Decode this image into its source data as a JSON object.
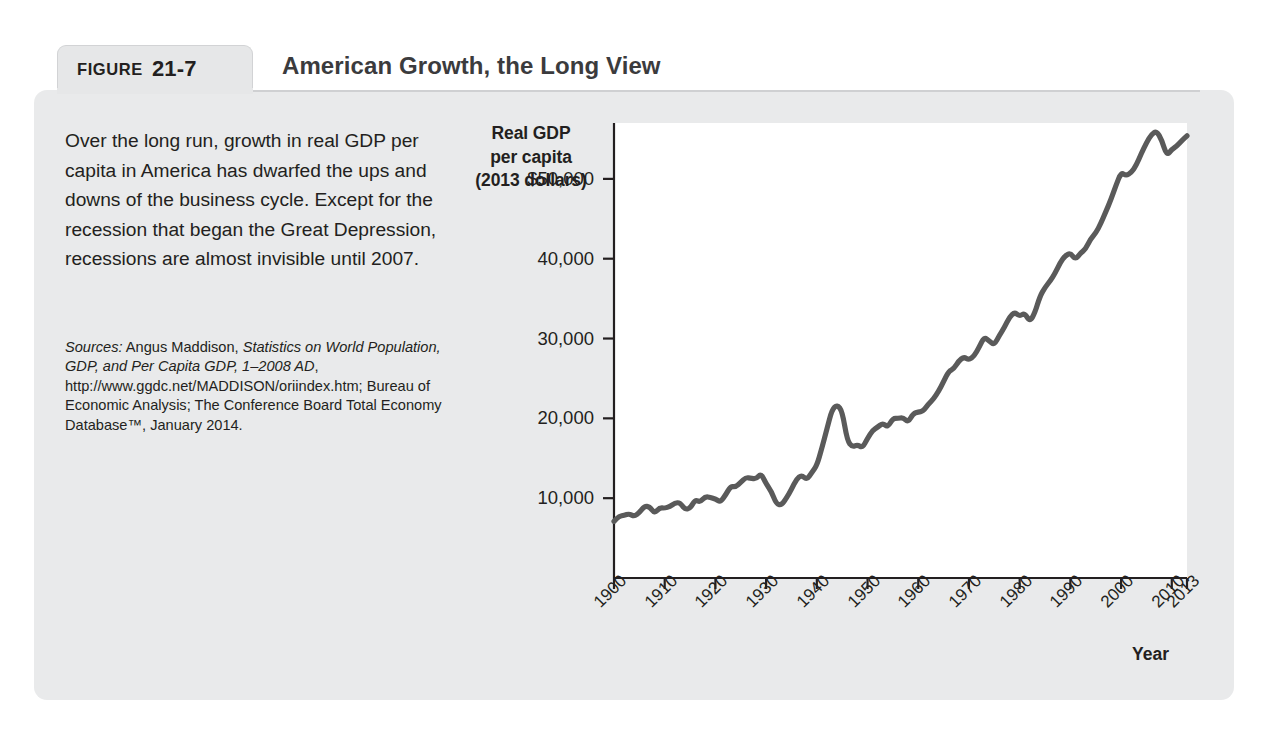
{
  "figure": {
    "tab_word": "FIGURE",
    "number": "21-7",
    "title": "American Growth, the Long View"
  },
  "caption": {
    "text": "Over the long run, growth in real GDP per capita in America has dwarfed the ups and downs of the business cycle. Except for the recession that began the Great Depression, recessions are almost invisible until 2007."
  },
  "sources": {
    "label": "Sources:",
    "part1": " Angus Maddison, ",
    "work": "Statistics on World Population, GDP, and Per Capita GDP, 1–2008 AD",
    "part2": ", http://www.ggdc.net/MADDISON/oriindex.htm; Bureau of Economic Analysis; The Conference Board Total Economy Database™, January 2014."
  },
  "colors": {
    "card_background": "#e9eaeb",
    "tab_background": "#e6e7e8",
    "line": "#5a5a5a",
    "axis": "#231f20",
    "plot_background": "#ffffff",
    "text": "#231f20"
  },
  "chart_data": {
    "type": "line",
    "title": "American Growth, the Long View",
    "xlabel": "Year",
    "ylabel": "Real GDP per capita (2013 dollars)",
    "ylabel_lines": [
      "Real GDP",
      "per capita",
      "(2013 dollars)"
    ],
    "xlim": [
      1900,
      2013
    ],
    "ylim": [
      0,
      57000
    ],
    "grid": false,
    "legend": false,
    "ytick_labels": [
      "$50,000",
      "40,000",
      "30,000",
      "20,000",
      "10,000"
    ],
    "ytick_values": [
      50000,
      40000,
      30000,
      20000,
      10000
    ],
    "xtick_labels": [
      "1900",
      "1910",
      "1920",
      "1930",
      "1940",
      "1950",
      "1960",
      "1970",
      "1980",
      "1990",
      "2000",
      "2010",
      "2013"
    ],
    "xtick_values": [
      1900,
      1910,
      1920,
      1930,
      1940,
      1950,
      1960,
      1970,
      1980,
      1990,
      2000,
      2010,
      2013
    ],
    "series": [
      {
        "name": "Real GDP per capita (2013 dollars)",
        "x": [
          1900,
          1901,
          1902,
          1903,
          1904,
          1905,
          1906,
          1907,
          1908,
          1909,
          1910,
          1911,
          1912,
          1913,
          1914,
          1915,
          1916,
          1917,
          1918,
          1919,
          1920,
          1921,
          1922,
          1923,
          1924,
          1925,
          1926,
          1927,
          1928,
          1929,
          1930,
          1931,
          1932,
          1933,
          1934,
          1935,
          1936,
          1937,
          1938,
          1939,
          1940,
          1941,
          1942,
          1943,
          1944,
          1945,
          1946,
          1947,
          1948,
          1949,
          1950,
          1951,
          1952,
          1953,
          1954,
          1955,
          1956,
          1957,
          1958,
          1959,
          1960,
          1961,
          1962,
          1963,
          1964,
          1965,
          1966,
          1967,
          1968,
          1969,
          1970,
          1971,
          1972,
          1973,
          1974,
          1975,
          1976,
          1977,
          1978,
          1979,
          1980,
          1981,
          1982,
          1983,
          1984,
          1985,
          1986,
          1987,
          1988,
          1989,
          1990,
          1991,
          1992,
          1993,
          1994,
          1995,
          1996,
          1997,
          1998,
          1999,
          2000,
          2001,
          2002,
          2003,
          2004,
          2005,
          2006,
          2007,
          2008,
          2009,
          2010,
          2011,
          2012,
          2013
        ],
        "values": [
          7100,
          7750,
          7850,
          8050,
          7700,
          8200,
          9000,
          8950,
          8100,
          8800,
          8750,
          8950,
          9400,
          9450,
          8600,
          8700,
          9800,
          9500,
          10200,
          10100,
          9900,
          9500,
          10400,
          11500,
          11400,
          12000,
          12600,
          12500,
          12400,
          13100,
          11800,
          10900,
          9300,
          9100,
          10000,
          11100,
          12400,
          12900,
          12300,
          13200,
          14100,
          16300,
          18700,
          21100,
          21700,
          20900,
          17200,
          16400,
          16700,
          16300,
          17500,
          18500,
          18900,
          19400,
          18900,
          20000,
          20000,
          20100,
          19500,
          20600,
          20800,
          20900,
          21800,
          22400,
          23400,
          24600,
          25900,
          26200,
          27200,
          27700,
          27300,
          27800,
          28900,
          30200,
          29700,
          29200,
          30400,
          31400,
          32700,
          33300,
          32800,
          33200,
          32100,
          33200,
          35300,
          36400,
          37200,
          38200,
          39500,
          40400,
          40700,
          39900,
          40700,
          41200,
          42500,
          43200,
          44400,
          45900,
          47400,
          49200,
          50800,
          50400,
          50800,
          51700,
          53200,
          54500,
          55600,
          56000,
          54900,
          52900,
          53700,
          54100,
          54800,
          55400
        ],
        "color": "#5a5a5a"
      }
    ],
    "annotations": [
      {
        "label": "Great Depression trough",
        "x": 1933,
        "y": 9100
      },
      {
        "label": "World War II peak",
        "x": 1944,
        "y": 21700
      },
      {
        "label": "2007–2009 recession",
        "x": 2009,
        "y": 52900
      }
    ]
  }
}
